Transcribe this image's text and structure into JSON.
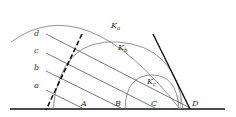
{
  "diagram": {
    "type": "geometric-construction",
    "colors": {
      "thin": "#555555",
      "thick": "#111111",
      "arc": "#777777",
      "text": "#333333"
    },
    "parallel_lines": [
      {
        "label": "a",
        "end_label": "A"
      },
      {
        "label": "b",
        "end_label": "B"
      },
      {
        "label": "c",
        "end_label": "C"
      },
      {
        "label": "d",
        "end_label": "D"
      }
    ],
    "arcs": [
      {
        "name": "K",
        "sub": "a"
      },
      {
        "name": "K",
        "sub": "b"
      },
      {
        "name": "K",
        "sub": "c"
      }
    ]
  }
}
